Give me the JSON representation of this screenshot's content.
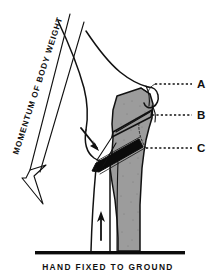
{
  "figure": {
    "background_color": "#ffffff",
    "ink_color": "#111111",
    "bone_fill_color": "#9c9c9c",
    "implant_color": "#0b0b0b"
  },
  "annotations": {
    "momentum_label": "MOMENTUM OF BODY WEIGHT",
    "caption": "HAND FIXED TO GROUND"
  },
  "callouts": [
    {
      "id": "A",
      "label": "A",
      "leader_style": "dotted"
    },
    {
      "id": "B",
      "label": "B",
      "leader_style": "dotted"
    },
    {
      "id": "C",
      "label": "C",
      "leader_style": "dotted"
    }
  ],
  "force_arrows": [
    {
      "name": "momentum-of-body-weight-arrow",
      "direction": "down-left",
      "style": "outline-hollow"
    },
    {
      "name": "joint-compression-arrow",
      "direction": "down-right",
      "style": "solid-filled"
    },
    {
      "name": "ground-reaction-arrow",
      "direction": "up",
      "style": "solid-filled"
    }
  ],
  "icons": {
    "hollow_arrow": "hollow-arrow-icon",
    "solid_arrow": "solid-arrow-icon",
    "ground_line": "ground-line-icon"
  }
}
